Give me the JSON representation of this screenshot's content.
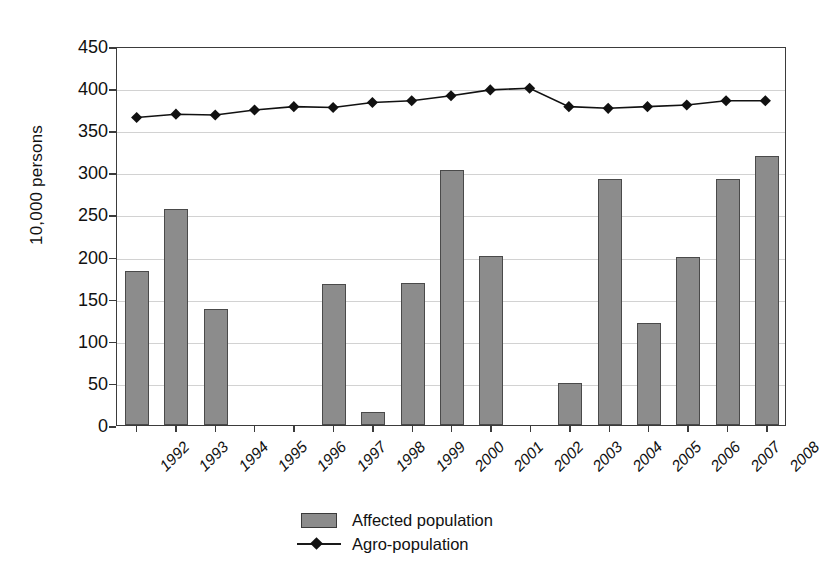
{
  "chart_data": {
    "type": "bar",
    "title": "",
    "subtitle": "",
    "xlabel": "",
    "ylabel": "10,000 persons",
    "ylim": [
      0,
      450
    ],
    "ytick_step": 50,
    "yticks": [
      0,
      50,
      100,
      150,
      200,
      250,
      300,
      350,
      400,
      450
    ],
    "grid": true,
    "legend_position": "bottom-center",
    "categories": [
      "1992",
      "1993",
      "1994",
      "1995",
      "1996",
      "1997",
      "1998",
      "1999",
      "2000",
      "2001",
      "2002",
      "2003",
      "2004",
      "2005",
      "2006",
      "2007",
      "2008"
    ],
    "series": [
      {
        "name": "Affected population",
        "type": "bar",
        "color": "#8c8c8c",
        "edge_color": "#4a4a4a",
        "values": [
          183,
          257,
          138,
          0,
          0,
          167,
          15,
          169,
          303,
          201,
          0,
          50,
          292,
          121,
          199,
          292,
          320
        ]
      },
      {
        "name": "Agro-population",
        "type": "line",
        "color": "#111111",
        "marker": "diamond",
        "values": [
          367,
          371,
          370,
          376,
          380,
          379,
          385,
          387,
          393,
          400,
          402,
          380,
          378,
          380,
          382,
          387,
          387
        ]
      }
    ]
  },
  "axis": {
    "y_title": "10,000 persons"
  },
  "legend": {
    "items": [
      {
        "label": "Affected population",
        "marker": "bar-swatch"
      },
      {
        "label": "Agro-population",
        "marker": "line-diamond"
      }
    ]
  }
}
